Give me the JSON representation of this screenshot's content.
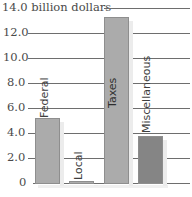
{
  "chart_data": {
    "type": "bar",
    "title": "",
    "ylabel": "billion dollars",
    "xlabel": "",
    "categories": [
      "Federal",
      "Local",
      "Taxes",
      "Miscellaneous"
    ],
    "values": [
      5.2,
      0.2,
      13.3,
      3.75
    ],
    "colors": [
      "#ababab",
      "#ababab",
      "#ababab",
      "#858585"
    ],
    "ylim": [
      0,
      14.0
    ],
    "yticks": [
      0,
      2.0,
      4.0,
      6.0,
      8.0,
      10.0,
      12.0,
      14.0
    ],
    "ytick_labels": [
      "0",
      "2.0",
      "4.0",
      "6.0",
      "8.0",
      "10.0",
      "12.0",
      "14.0 billion dollars"
    ],
    "grid": true,
    "legend": "none",
    "labels_inside_bars": true
  },
  "layout": {
    "baseline_y": 183,
    "px_per_unit": 12.5,
    "bar_x": [
      35,
      69,
      104,
      138
    ],
    "bar_width": 25
  }
}
